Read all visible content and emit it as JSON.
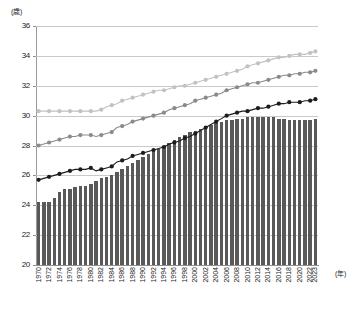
{
  "chart_data": {
    "type": "bar",
    "title": "",
    "xlabel": "(年)",
    "ylabel": "(歳)",
    "ylim": [
      20,
      36
    ],
    "ytick_step": 2,
    "yticks": [
      20,
      22,
      24,
      26,
      28,
      30,
      32,
      34,
      36
    ],
    "grid": "horizontal",
    "legend_position": "none",
    "x": [
      1970,
      1971,
      1972,
      1973,
      1974,
      1975,
      1976,
      1977,
      1978,
      1979,
      1980,
      1981,
      1982,
      1983,
      1984,
      1985,
      1986,
      1987,
      1988,
      1989,
      1990,
      1991,
      1992,
      1993,
      1994,
      1995,
      1996,
      1997,
      1998,
      1999,
      2000,
      2001,
      2002,
      2003,
      2004,
      2005,
      2006,
      2007,
      2008,
      2009,
      2010,
      2011,
      2012,
      2013,
      2014,
      2015,
      2016,
      2017,
      2018,
      2019,
      2020,
      2021,
      2022,
      2023
    ],
    "xtick_labels": [
      "1970",
      "1972",
      "1974",
      "1976",
      "1978",
      "1980",
      "1982",
      "1984",
      "1986",
      "1988",
      "1990",
      "1992",
      "1994",
      "1996",
      "1998",
      "2000",
      "2002",
      "2004",
      "2006",
      "2008",
      "2010",
      "2012",
      "2014",
      "2016",
      "2018",
      "2020",
      "2022",
      "2023"
    ],
    "series": [
      {
        "name": "bars",
        "type": "bar",
        "color": "#595959",
        "values": [
          24.2,
          24.2,
          24.2,
          24.5,
          24.9,
          25.1,
          25.1,
          25.2,
          25.3,
          25.3,
          25.4,
          25.6,
          25.8,
          25.9,
          26.0,
          26.2,
          26.4,
          26.6,
          26.8,
          27.0,
          27.2,
          27.4,
          27.6,
          27.8,
          28.0,
          28.2,
          28.4,
          28.6,
          28.7,
          28.9,
          29.0,
          29.1,
          29.3,
          29.4,
          29.5,
          29.6,
          29.7,
          29.7,
          29.8,
          29.8,
          29.9,
          29.9,
          29.9,
          29.9,
          29.9,
          29.9,
          29.8,
          29.8,
          29.7,
          29.7,
          29.7,
          29.7,
          29.7,
          29.8
        ]
      },
      {
        "name": "light-gray-line",
        "type": "line",
        "color": "#c2c2c2",
        "values": [
          30.3,
          30.3,
          30.3,
          30.3,
          30.3,
          30.3,
          30.3,
          30.3,
          30.3,
          30.3,
          30.3,
          30.3,
          30.4,
          30.6,
          30.7,
          30.8,
          31.0,
          31.1,
          31.2,
          31.3,
          31.4,
          31.5,
          31.6,
          31.7,
          31.7,
          31.8,
          31.9,
          32.0,
          32.0,
          32.1,
          32.2,
          32.3,
          32.4,
          32.5,
          32.6,
          32.7,
          32.8,
          32.9,
          33.0,
          33.1,
          33.3,
          33.4,
          33.5,
          33.6,
          33.7,
          33.8,
          33.9,
          33.9,
          34.0,
          34.1,
          34.1,
          34.1,
          34.2,
          34.3
        ]
      },
      {
        "name": "medium-gray-line",
        "type": "line",
        "color": "#8a8a8a",
        "values": [
          28.0,
          28.1,
          28.2,
          28.3,
          28.4,
          28.5,
          28.6,
          28.6,
          28.7,
          28.7,
          28.7,
          28.6,
          28.7,
          28.8,
          28.9,
          29.2,
          29.3,
          29.4,
          29.6,
          29.7,
          29.8,
          29.9,
          30.0,
          30.1,
          30.2,
          30.4,
          30.5,
          30.6,
          30.7,
          30.8,
          31.0,
          31.1,
          31.2,
          31.3,
          31.4,
          31.5,
          31.7,
          31.8,
          31.9,
          32.0,
          32.1,
          32.2,
          32.2,
          32.3,
          32.4,
          32.5,
          32.6,
          32.7,
          32.7,
          32.8,
          32.8,
          32.9,
          32.9,
          33.0
        ]
      },
      {
        "name": "black-line",
        "type": "line",
        "color": "#1c1c1c",
        "values": [
          25.7,
          25.8,
          25.9,
          26.0,
          26.1,
          26.2,
          26.3,
          26.4,
          26.4,
          26.4,
          26.5,
          26.3,
          26.4,
          26.5,
          26.6,
          26.9,
          27.0,
          27.1,
          27.3,
          27.4,
          27.5,
          27.6,
          27.7,
          27.8,
          27.9,
          28.1,
          28.2,
          28.3,
          28.5,
          28.6,
          28.8,
          29.0,
          29.2,
          29.4,
          29.6,
          29.8,
          30.0,
          30.1,
          30.2,
          30.3,
          30.3,
          30.4,
          30.5,
          30.5,
          30.6,
          30.7,
          30.8,
          30.8,
          30.9,
          30.9,
          30.9,
          31.0,
          31.0,
          31.1
        ]
      }
    ]
  }
}
